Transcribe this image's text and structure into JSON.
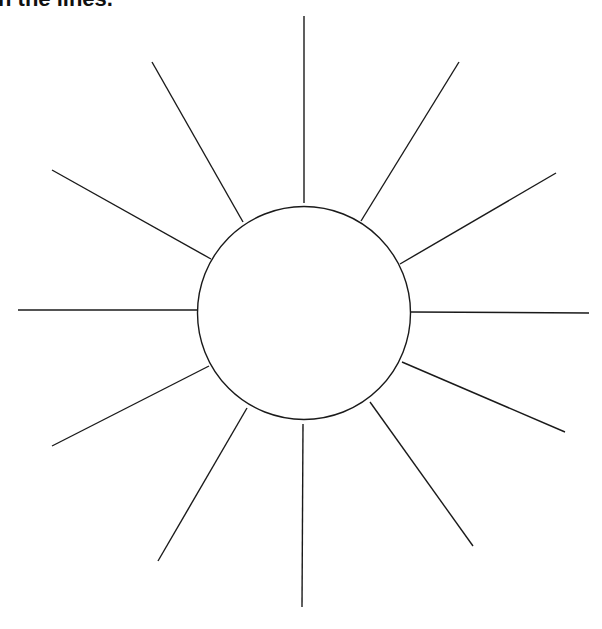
{
  "instruction": {
    "text": "n the lines."
  },
  "diagram": {
    "type": "sun-ray-organizer",
    "center_shape": "circle",
    "center_label": "",
    "ray_count": 12,
    "rays": [
      {
        "id": "top",
        "label": ""
      },
      {
        "id": "upper-right",
        "label": ""
      },
      {
        "id": "right-upper",
        "label": ""
      },
      {
        "id": "right",
        "label": ""
      },
      {
        "id": "right-lower",
        "label": ""
      },
      {
        "id": "lower-right",
        "label": ""
      },
      {
        "id": "bottom",
        "label": ""
      },
      {
        "id": "lower-left",
        "label": ""
      },
      {
        "id": "left-lower",
        "label": ""
      },
      {
        "id": "left",
        "label": ""
      },
      {
        "id": "left-upper",
        "label": ""
      },
      {
        "id": "upper-left",
        "label": ""
      }
    ],
    "line_color": "#1a1a1a",
    "background_color": "#ffffff"
  }
}
